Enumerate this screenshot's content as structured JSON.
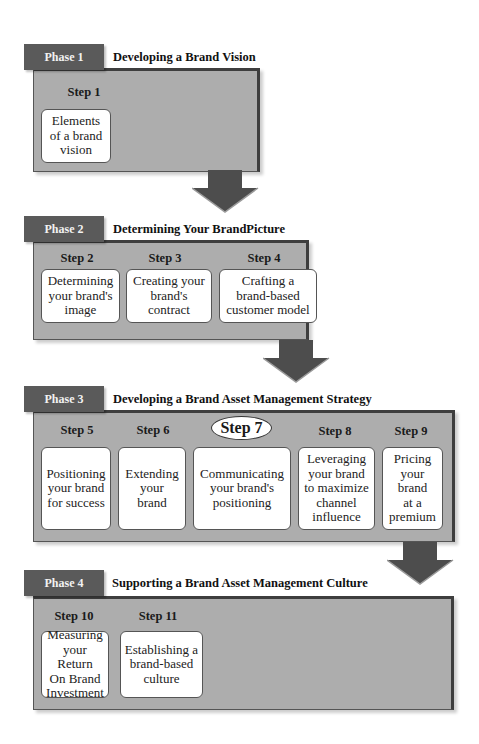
{
  "phases": [
    {
      "tab": "Phase 1",
      "title": "Developing a Brand Vision",
      "steps": [
        {
          "label": "Step 1",
          "text": "Elements\nof a brand\nvision"
        }
      ]
    },
    {
      "tab": "Phase 2",
      "title": "Determining Your BrandPicture",
      "steps": [
        {
          "label": "Step 2",
          "text": "Determining\nyour brand's\nimage"
        },
        {
          "label": "Step 3",
          "text": "Creating your\nbrand's\ncontract"
        },
        {
          "label": "Step 4",
          "text": "Crafting a\nbrand-based\ncustomer model"
        }
      ]
    },
    {
      "tab": "Phase 3",
      "title": "Developing a Brand Asset Management Strategy",
      "steps": [
        {
          "label": "Step 5",
          "text": "Positioning\nyour brand\nfor success"
        },
        {
          "label": "Step 6",
          "text": "Extending\nyour\nbrand"
        },
        {
          "label": "Step 7",
          "text": "Communicating\nyour brand's\npositioning",
          "highlighted": true
        },
        {
          "label": "Step 8",
          "text": "Leveraging\nyour brand\nto maximize\nchannel\ninfluence"
        },
        {
          "label": "Step 9",
          "text": "Pricing\nyour\nbrand\nat a\npremium"
        }
      ]
    },
    {
      "tab": "Phase 4",
      "title": "Supporting a Brand Asset Management Culture",
      "steps": [
        {
          "label": "Step 10",
          "text": "Measuring\nyour Return\nOn Brand\nInvestment"
        },
        {
          "label": "Step 11",
          "text": "Establishing a\nbrand-based\nculture"
        }
      ]
    }
  ],
  "colors": {
    "tab_fill": "#5a5a5a",
    "panel_fill": "#adadad",
    "panel_border": "#3e3e3e",
    "arrow_fill": "#4d4d4d",
    "step_box_fill": "#ffffff"
  }
}
